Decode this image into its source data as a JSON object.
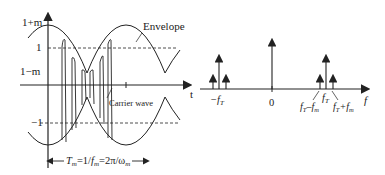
{
  "left_plot": {
    "y_labels": {
      "top": "1+m",
      "one": "1",
      "low": "1−m",
      "neg_one": "−1"
    },
    "x_axis_label": "t",
    "envelope_label": "Envelope",
    "carrier_label": "Carrier wave",
    "period_label": "Tₘ=1/fₘ=2π/ωₘ",
    "period_parts": {
      "T": "T",
      "m1": "m",
      "eq1": "=1/",
      "f": "f",
      "m2": "m",
      "eq2": "=2π/ω",
      "m3": "m"
    }
  },
  "right_plot": {
    "x_axis_label": "f",
    "zero_label": "0",
    "neg_carrier_label": "−f",
    "neg_carrier_sub": "T",
    "carrier_label": "f",
    "carrier_sub": "T",
    "lower_sideband_label": "fₜ−fₘ",
    "upper_sideband_label": "fₜ+fₘ",
    "lsb": {
      "f": "f",
      "T": "T",
      "minus": "–f",
      "m": "m"
    },
    "usb": {
      "f": "f",
      "T": "T",
      "plus": "+f",
      "m": "m"
    }
  },
  "colors": {
    "line": "#222222",
    "background": "#ffffff"
  }
}
